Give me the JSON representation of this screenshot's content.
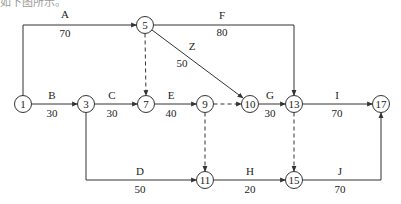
{
  "caption": "如下图所示。",
  "colors": {
    "line": "#333333",
    "node_fill": "#ffffff",
    "text": "#222222"
  },
  "nodes": [
    {
      "id": "1",
      "x": 23,
      "y": 104
    },
    {
      "id": "3",
      "x": 86,
      "y": 104
    },
    {
      "id": "5",
      "x": 145,
      "y": 25
    },
    {
      "id": "7",
      "x": 146,
      "y": 104
    },
    {
      "id": "9",
      "x": 205,
      "y": 104
    },
    {
      "id": "10",
      "x": 250,
      "y": 104
    },
    {
      "id": "13",
      "x": 294,
      "y": 104
    },
    {
      "id": "17",
      "x": 381,
      "y": 104
    },
    {
      "id": "11",
      "x": 205,
      "y": 180
    },
    {
      "id": "15",
      "x": 294,
      "y": 180
    }
  ],
  "activities": [
    {
      "name": "A",
      "duration": "70",
      "from": "1",
      "to": "5",
      "dummy": false,
      "points": [
        [
          23,
          95.5
        ],
        [
          23,
          25
        ],
        [
          136.5,
          25
        ]
      ],
      "label_pos": [
        65,
        18
      ],
      "duration_pos": [
        65,
        37
      ]
    },
    {
      "name": "F",
      "duration": "80",
      "from": "5",
      "to": "13",
      "dummy": false,
      "points": [
        [
          153.5,
          25
        ],
        [
          294,
          25
        ],
        [
          294,
          95.5
        ]
      ],
      "label_pos": [
        222,
        19
      ],
      "duration_pos": [
        222,
        36
      ]
    },
    {
      "name": "Z",
      "duration": "50",
      "from": "5",
      "to": "10",
      "dummy": false,
      "points": [
        [
          152,
          30
        ],
        [
          243,
          98
        ]
      ],
      "label_pos": [
        192,
        50
      ],
      "duration_pos": [
        182,
        67
      ]
    },
    {
      "name": "B",
      "duration": "30",
      "from": "1",
      "to": "3",
      "dummy": false,
      "points": [
        [
          31.5,
          104
        ],
        [
          77.5,
          104
        ]
      ],
      "label_pos": [
        52,
        99
      ],
      "duration_pos": [
        52,
        117
      ]
    },
    {
      "name": "C",
      "duration": "30",
      "from": "3",
      "to": "7",
      "dummy": false,
      "points": [
        [
          94.5,
          104
        ],
        [
          137.5,
          104
        ]
      ],
      "label_pos": [
        112,
        99
      ],
      "duration_pos": [
        112,
        117
      ]
    },
    {
      "name": "E",
      "duration": "40",
      "from": "7",
      "to": "9",
      "dummy": false,
      "points": [
        [
          154.5,
          104
        ],
        [
          196.5,
          104
        ]
      ],
      "label_pos": [
        171,
        99
      ],
      "duration_pos": [
        171,
        117
      ]
    },
    {
      "name": "G",
      "duration": "30",
      "from": "10",
      "to": "13",
      "dummy": false,
      "points": [
        [
          258.5,
          104
        ],
        [
          285.5,
          104
        ]
      ],
      "label_pos": [
        270,
        99
      ],
      "duration_pos": [
        270,
        117
      ]
    },
    {
      "name": "I",
      "duration": "70",
      "from": "13",
      "to": "17",
      "dummy": false,
      "points": [
        [
          302.5,
          104
        ],
        [
          372.5,
          104
        ]
      ],
      "label_pos": [
        337,
        99
      ],
      "duration_pos": [
        337,
        117
      ]
    },
    {
      "name": "D",
      "duration": "50",
      "from": "3",
      "to": "11",
      "dummy": false,
      "points": [
        [
          86,
          112.5
        ],
        [
          86,
          180
        ],
        [
          196.5,
          180
        ]
      ],
      "label_pos": [
        140,
        175
      ],
      "duration_pos": [
        140,
        193
      ]
    },
    {
      "name": "H",
      "duration": "20",
      "from": "11",
      "to": "15",
      "dummy": false,
      "points": [
        [
          213.5,
          180
        ],
        [
          285.5,
          180
        ]
      ],
      "label_pos": [
        250,
        175
      ],
      "duration_pos": [
        250,
        193
      ]
    },
    {
      "name": "J",
      "duration": "70",
      "from": "15",
      "to": "17",
      "dummy": false,
      "points": [
        [
          302.5,
          180
        ],
        [
          381,
          180
        ],
        [
          381,
          112.5
        ]
      ],
      "label_pos": [
        340,
        175
      ],
      "duration_pos": [
        340,
        193
      ]
    },
    {
      "name": "",
      "duration": "",
      "from": "5",
      "to": "7",
      "dummy": true,
      "points": [
        [
          145,
          33.5
        ],
        [
          146,
          95.5
        ]
      ]
    },
    {
      "name": "",
      "duration": "",
      "from": "9",
      "to": "10",
      "dummy": true,
      "points": [
        [
          213.5,
          104
        ],
        [
          241.5,
          104
        ]
      ]
    },
    {
      "name": "",
      "duration": "",
      "from": "9",
      "to": "11",
      "dummy": true,
      "points": [
        [
          205,
          112.5
        ],
        [
          205,
          171.5
        ]
      ]
    },
    {
      "name": "",
      "duration": "",
      "from": "13",
      "to": "15",
      "dummy": true,
      "points": [
        [
          294,
          112.5
        ],
        [
          294,
          171.5
        ]
      ]
    }
  ]
}
